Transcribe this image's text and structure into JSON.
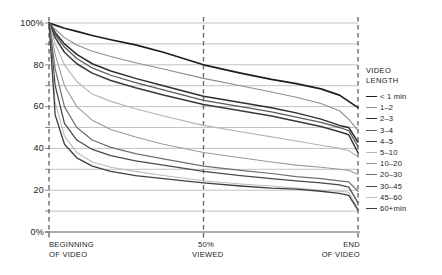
{
  "chart_data": {
    "type": "line",
    "title": "",
    "xlabel": "",
    "ylabel": "",
    "ylim": [
      0,
      100
    ],
    "grid": true,
    "legend_position": "right",
    "legend_title": "VIDEO\nLENGTH",
    "y_ticks_major": [
      "100%",
      "80",
      "60",
      "40",
      "20",
      "0%"
    ],
    "y_tick_values_major": [
      100,
      80,
      60,
      40,
      20,
      0
    ],
    "y_tick_values_minor": [
      90,
      70,
      50,
      30,
      10
    ],
    "x_ticks": [
      "BEGINNING\nOF VIDEO",
      "50%\nVIEWED",
      "END\nOF VIDEO"
    ],
    "x_tick_values": [
      0,
      50,
      100
    ],
    "x": [
      0,
      2,
      5,
      9,
      14,
      20,
      28,
      37,
      50,
      62,
      72,
      80,
      88,
      94,
      97,
      100
    ],
    "series": [
      {
        "name": "< 1 min",
        "color": "#1d1d1d",
        "width": 1.7,
        "values": [
          100,
          99,
          97.5,
          96,
          94,
          92,
          89.5,
          86,
          80,
          76,
          73,
          71,
          68.5,
          65.5,
          62.5,
          59.5
        ]
      },
      {
        "name": "1–2",
        "color": "#8e8e8e",
        "width": 1.1,
        "values": [
          100,
          97,
          93,
          89.5,
          86.5,
          84,
          81,
          78,
          73.5,
          70,
          67,
          64.5,
          61.5,
          58,
          54,
          48.5
        ]
      },
      {
        "name": "2–3",
        "color": "#2e2e2e",
        "width": 1.5,
        "values": [
          100,
          95.5,
          90,
          85,
          80.5,
          77,
          73.5,
          70,
          65,
          62,
          59.5,
          57,
          54,
          51,
          50,
          43
        ]
      },
      {
        "name": "3–4",
        "color": "#5a5a5a",
        "width": 1.3,
        "values": [
          100,
          94.5,
          88.5,
          83,
          78.5,
          75,
          71.5,
          68,
          63,
          60,
          57.5,
          55,
          52.5,
          50,
          48.5,
          41
        ]
      },
      {
        "name": "4–5",
        "color": "#3a3a3a",
        "width": 1.5,
        "values": [
          100,
          93,
          86,
          80.5,
          76,
          72.5,
          69,
          65.5,
          61,
          58,
          55.5,
          53,
          50.5,
          48,
          46.5,
          38
        ]
      },
      {
        "name": "5–10",
        "color": "#b4b4b4",
        "width": 1.1,
        "values": [
          100,
          90,
          80,
          72,
          66,
          62.5,
          59,
          55.5,
          51,
          48,
          45.5,
          43.5,
          41.5,
          40,
          39,
          36
        ]
      },
      {
        "name": "10–20",
        "color": "#9a9a9a",
        "width": 1.1,
        "values": [
          100,
          85,
          70,
          60,
          53.5,
          49,
          45.5,
          42,
          38,
          35.5,
          33.5,
          32,
          31,
          30,
          29.5,
          27.5
        ]
      },
      {
        "name": "20–30",
        "color": "#6e6e6e",
        "width": 1.2,
        "values": [
          100,
          78,
          60,
          50,
          44,
          40.5,
          37.5,
          35,
          31.5,
          29.5,
          28,
          26.5,
          25.5,
          24.5,
          24,
          19.5
        ]
      },
      {
        "name": "30–45",
        "color": "#4a4a4a",
        "width": 1.3,
        "values": [
          100,
          70,
          52,
          44,
          39.5,
          36.5,
          34,
          32,
          29,
          27,
          25.5,
          24.5,
          23.5,
          22.5,
          21.5,
          14
        ]
      },
      {
        "name": "45–60",
        "color": "#bdbdbd",
        "width": 1.1,
        "values": [
          100,
          62,
          46,
          38,
          33.5,
          31,
          29,
          27,
          24.5,
          23,
          22,
          21,
          20,
          19.5,
          19,
          11
        ]
      },
      {
        "name": "60+min",
        "color": "#3f3f3f",
        "width": 1.3,
        "values": [
          100,
          56,
          42,
          35.5,
          31.5,
          29,
          27,
          25.5,
          23.5,
          22,
          21,
          20.5,
          19.5,
          18.5,
          17.5,
          10.5
        ]
      }
    ]
  },
  "axes": {
    "gridline_color": "#a9a9a9",
    "marker_color": "#6b6b6b",
    "axis_color": "#4a4a4a"
  }
}
